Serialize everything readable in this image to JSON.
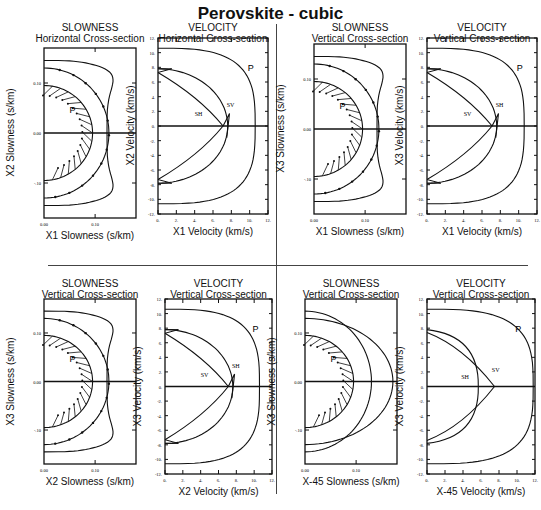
{
  "title": "Perovskite - cubic",
  "colors": {
    "line": "#111111",
    "background": "#ffffff"
  },
  "chart_data": [
    {
      "id": "p1",
      "type": "line",
      "title": "SLOWNESS",
      "subtitle": "Horizontal Cross-section",
      "xlabel": "X1 Slowness (s/km)",
      "ylabel": "X2 Slowness (s/km)",
      "xticks": [
        "0.00",
        "0.10"
      ],
      "yticks": [
        "0.10",
        "0.00",
        "-.10"
      ],
      "xlim": [
        0,
        0.2
      ],
      "ylim": [
        -0.2,
        0.2
      ],
      "curve_labels": [
        "P"
      ],
      "series": [
        {
          "name": "P",
          "r_on_axis": 0.095,
          "r_diag": 0.095
        },
        {
          "name": "S-inner",
          "r_on_axis": 0.127,
          "r_diag": 0.135
        },
        {
          "name": "S-outer",
          "r_on_axis": 0.127,
          "r_diag": 0.16
        }
      ]
    },
    {
      "id": "p2",
      "type": "line",
      "title": "VELOCITY",
      "subtitle": "Horizontal Cross-section",
      "xlabel": "X1 Velocity (km/s)",
      "ylabel": "X2 Velocity (km/s)",
      "xticks": [
        "0.",
        "2.",
        "4.",
        "6.",
        "8.",
        "10.",
        "12."
      ],
      "yticks": [
        "12.",
        "10.",
        "8.",
        "6.",
        "4.",
        "2.",
        "0.",
        "-2.",
        "-4.",
        "-6.",
        "-8.",
        "-10.",
        "-12."
      ],
      "xlim": [
        0,
        12
      ],
      "ylim": [
        -12,
        12
      ],
      "curve_labels": [
        "P",
        "SV",
        "SH"
      ],
      "series": [
        {
          "name": "P",
          "on_axis": 10.6
        },
        {
          "name": "SV",
          "on_axis": 7.8
        },
        {
          "name": "SH",
          "on_axis": 7.3
        }
      ]
    },
    {
      "id": "p3",
      "type": "line",
      "title": "SLOWNESS",
      "subtitle": "Vertical Cross-section",
      "xlabel": "X1 Slowness (s/km)",
      "ylabel": "X3 Slowness (s/km)",
      "xticks": [
        "0.00",
        "0.10"
      ],
      "yticks": [
        "0.10",
        "0.00",
        "-.10"
      ],
      "xlim": [
        0,
        0.2
      ],
      "ylim": [
        -0.2,
        0.2
      ],
      "curve_labels": [
        "P"
      ],
      "series": [
        {
          "name": "P",
          "r_on_axis": 0.095
        },
        {
          "name": "S-inner",
          "r_on_axis": 0.127
        },
        {
          "name": "S-outer",
          "r_on_axis": 0.127
        }
      ]
    },
    {
      "id": "p4",
      "type": "line",
      "title": "VELOCITY",
      "subtitle": "Vertical Cross-section",
      "xlabel": "X1 Velocity (km/s)",
      "ylabel": "X3 Velocity (km/s)",
      "xticks": [
        "0.",
        "2.",
        "4.",
        "6.",
        "8.",
        "10.",
        "12."
      ],
      "yticks": [
        "12.",
        "10.",
        "8.",
        "6.",
        "4.",
        "2.",
        "0.",
        "-2.",
        "-4.",
        "-6.",
        "-8.",
        "-10.",
        "-12."
      ],
      "xlim": [
        0,
        12
      ],
      "ylim": [
        -12,
        12
      ],
      "curve_labels": [
        "P",
        "SH",
        "SV"
      ],
      "series": [
        {
          "name": "P",
          "on_axis": 10.6
        },
        {
          "name": "SH",
          "on_axis": 7.8
        },
        {
          "name": "SV",
          "on_axis": 7.3
        }
      ]
    },
    {
      "id": "p5",
      "type": "line",
      "title": "SLOWNESS",
      "subtitle": "Vertical Cross-section",
      "xlabel": "X2 Slowness (s/km)",
      "ylabel": "X3 Slowness (s/km)",
      "xticks": [
        "0.00",
        "0.10"
      ],
      "yticks": [
        "0.10",
        "0.00",
        "-.10"
      ],
      "xlim": [
        0,
        0.2
      ],
      "ylim": [
        -0.2,
        0.2
      ],
      "curve_labels": [
        "P"
      ],
      "series": [
        {
          "name": "P",
          "r_on_axis": 0.095
        },
        {
          "name": "S-inner",
          "r_on_axis": 0.127
        },
        {
          "name": "S-outer",
          "r_on_axis": 0.127
        }
      ]
    },
    {
      "id": "p6",
      "type": "line",
      "title": "VELOCITY",
      "subtitle": "Vertical Cross-section",
      "xlabel": "X2 Velocity (km/s)",
      "ylabel": "X3 Velocity (km/s)",
      "xticks": [
        "0.",
        "2.",
        "4.",
        "6.",
        "8.",
        "10.",
        "12."
      ],
      "yticks": [
        "12.",
        "10.",
        "8.",
        "6.",
        "4.",
        "2.",
        "0.",
        "-2.",
        "-4.",
        "-6.",
        "-8.",
        "-10.",
        "-12."
      ],
      "xlim": [
        0,
        12
      ],
      "ylim": [
        -12,
        12
      ],
      "curve_labels": [
        "P",
        "SH",
        "SV"
      ],
      "series": [
        {
          "name": "P",
          "on_axis": 10.6
        },
        {
          "name": "SH",
          "on_axis": 7.8
        },
        {
          "name": "SV",
          "on_axis": 7.3
        }
      ]
    },
    {
      "id": "p7",
      "type": "line",
      "title": "SLOWNESS",
      "subtitle": "Vertical Cross-section",
      "xlabel": "X-45 Slowness (s/km)",
      "ylabel": "X3 Slowness (s/km)",
      "xticks": [
        "0.00",
        "0.10"
      ],
      "yticks": [
        "0.10",
        "0.00",
        "-.10"
      ],
      "xlim": [
        0,
        0.2
      ],
      "ylim": [
        -0.2,
        0.2
      ],
      "curve_labels": [
        "P"
      ],
      "series": [
        {
          "name": "P",
          "r_on_axis": 0.095
        },
        {
          "name": "S-1",
          "r_on_axis": 0.137
        },
        {
          "name": "S-2",
          "r_on_axis": 0.185
        }
      ]
    },
    {
      "id": "p8",
      "type": "line",
      "title": "VELOCITY",
      "subtitle": "Vertical Cross-section",
      "xlabel": "X-45 Velocity (km/s)",
      "ylabel": "X3 Velocity (km/s)",
      "xticks": [
        "0.",
        "2.",
        "4.",
        "6.",
        "8.",
        "10.",
        "12."
      ],
      "yticks": [
        "12.",
        "10.",
        "8.",
        "6.",
        "4.",
        "2.",
        "0.",
        "-2.",
        "-4.",
        "-6.",
        "-8.",
        "-10.",
        "-12."
      ],
      "xlim": [
        0,
        12
      ],
      "ylim": [
        -12,
        12
      ],
      "curve_labels": [
        "P",
        "SH",
        "SV"
      ],
      "series": [
        {
          "name": "P",
          "on_axis": 11.8
        },
        {
          "name": "SH",
          "on_axis": 5.7
        },
        {
          "name": "SV",
          "on_axis": 7.5
        }
      ]
    }
  ]
}
